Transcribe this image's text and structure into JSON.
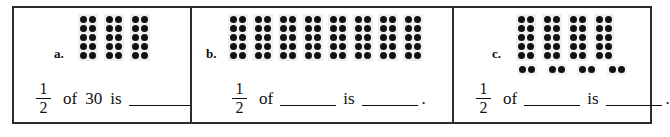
{
  "worksheet": {
    "panels": [
      {
        "id": "a",
        "label": "a.",
        "ten_frames": 3,
        "dots_per_frame": 10,
        "pair_groups": 0,
        "dots_per_pair": 2,
        "total_dots": 30,
        "sentence": {
          "fraction_numerator": "1",
          "fraction_denominator": "2",
          "word_of": "of",
          "value_of": "30",
          "word_is": "is",
          "value_is": "",
          "period": "."
        }
      },
      {
        "id": "b",
        "label": "b.",
        "ten_frames": 8,
        "dots_per_frame": 10,
        "pair_groups": 0,
        "dots_per_pair": 2,
        "total_dots": 80,
        "sentence": {
          "fraction_numerator": "1",
          "fraction_denominator": "2",
          "word_of": "of",
          "value_of": "",
          "word_is": "is",
          "value_is": "",
          "period": "."
        }
      },
      {
        "id": "c",
        "label": "c.",
        "ten_frames": 4,
        "dots_per_frame": 10,
        "pair_groups": 4,
        "dots_per_pair": 2,
        "total_dots": 48,
        "sentence": {
          "fraction_numerator": "1",
          "fraction_denominator": "2",
          "word_of": "of",
          "value_of": "",
          "word_is": "is",
          "value_is": "",
          "period": "."
        }
      }
    ],
    "colors": {
      "border": "#2c2c2c",
      "dot": "#111111",
      "frame_background": "#f0f0f0",
      "page_background": "#ffffff"
    }
  }
}
